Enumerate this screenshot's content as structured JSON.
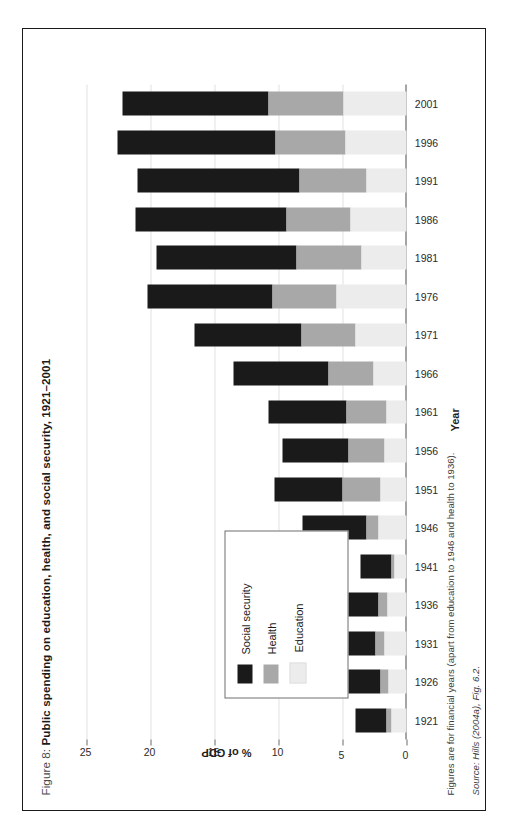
{
  "figure": {
    "label": "Figure 8:",
    "title": "Public spending on education, health, and social security, 1921–2001",
    "full_title": "Figure 8: Public spending on education, health, and social security, 1921–2001"
  },
  "notes": {
    "footnote": "Figures are for financial years (apart from education to 1946 and health to 1936).",
    "source": "Source: Hills (2004a), Fig. 6.2."
  },
  "legend": {
    "items": [
      {
        "label": "Social security",
        "color": "#1a1a1a"
      },
      {
        "label": "Health",
        "color": "#a8a8a8"
      },
      {
        "label": "Education",
        "color": "#ececec"
      }
    ]
  },
  "chart_data": {
    "type": "bar",
    "orientation": "horizontal",
    "stacked": true,
    "title": "Public spending on education, health, and social security, 1921–2001",
    "xlabel": "Year",
    "ylabel": "% of GDP",
    "ylim": [
      0,
      25
    ],
    "yticks": [
      0,
      5,
      10,
      15,
      20,
      25
    ],
    "ytick_labels": [
      "0",
      "5",
      "10",
      "15",
      "20",
      "25"
    ],
    "grid": true,
    "legend_position": "inside-lower-left",
    "categories": [
      "1921",
      "1926",
      "1931",
      "1936",
      "1941",
      "1946",
      "1951",
      "1956",
      "1961",
      "1966",
      "1971",
      "1976",
      "1981",
      "1986",
      "1991",
      "1996",
      "2001"
    ],
    "series": [
      {
        "name": "Social security",
        "color": "#1a1a1a",
        "values": [
          2.4,
          3.5,
          5.1,
          4.1,
          2.4,
          5.0,
          5.3,
          5.2,
          6.1,
          7.4,
          8.4,
          9.7,
          10.9,
          11.8,
          12.6,
          12.4,
          11.4
        ]
      },
      {
        "name": "Health",
        "color": "#a8a8a8",
        "values": [
          0.4,
          0.6,
          0.7,
          0.7,
          0.3,
          0.9,
          3.0,
          2.8,
          3.1,
          3.5,
          4.2,
          5.0,
          5.1,
          5.0,
          5.3,
          5.4,
          5.9
        ]
      },
      {
        "name": "Education",
        "color": "#ececec",
        "values": [
          1.2,
          1.4,
          1.7,
          1.5,
          0.9,
          2.2,
          2.0,
          1.7,
          1.6,
          2.6,
          4.0,
          5.5,
          3.5,
          4.4,
          3.1,
          4.8,
          4.9
        ]
      }
    ],
    "totals": [
      4.0,
      5.5,
      7.5,
      6.3,
      3.6,
      8.1,
      10.3,
      9.7,
      10.8,
      13.5,
      16.6,
      20.2,
      19.5,
      21.2,
      21.0,
      22.6,
      22.2
    ]
  }
}
